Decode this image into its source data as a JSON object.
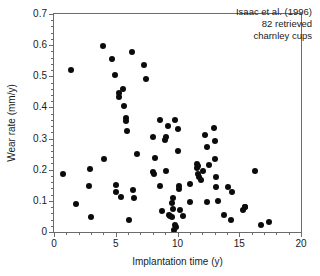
{
  "chart_data": {
    "type": "scatter",
    "title": "",
    "xlabel": "Implantation time (y)",
    "ylabel": "Wear rate (mm/y)",
    "xlim": [
      0,
      20
    ],
    "ylim": [
      0,
      0.7
    ],
    "xticks": [
      "0",
      "5",
      "10",
      "15",
      "20"
    ],
    "xtick_values": [
      0,
      5,
      10,
      15,
      20
    ],
    "yticks": [
      "0",
      "0.1",
      "0.2",
      "0.3",
      "0.4",
      "0.5",
      "0.6",
      "0.7"
    ],
    "ytick_values": [
      0,
      0.1,
      0.2,
      0.3,
      0.4,
      0.5,
      0.6,
      0.7
    ],
    "x_minor_step": 1,
    "y_minor_step": 0.02,
    "grid": false,
    "legend": "none",
    "marker": "filled-circle",
    "marker_color": "#0b0b0b",
    "marker_size_px": 6,
    "axis_color": "#6b6b6b",
    "n_points": 82,
    "series": [
      {
        "name": "82 retrieved charnley cups",
        "points": [
          [
            0.75,
            0.185
          ],
          [
            1.35,
            0.52
          ],
          [
            1.8,
            0.09
          ],
          [
            2.95,
            0.203
          ],
          [
            2.85,
            0.147
          ],
          [
            3.0,
            0.049
          ],
          [
            3.95,
            0.598
          ],
          [
            4.05,
            0.234
          ],
          [
            4.7,
            0.556
          ],
          [
            4.95,
            0.505
          ],
          [
            5.0,
            0.151
          ],
          [
            5.05,
            0.129
          ],
          [
            5.25,
            0.434
          ],
          [
            5.3,
            0.447
          ],
          [
            5.45,
            0.111
          ],
          [
            5.6,
            0.459
          ],
          [
            5.65,
            0.404
          ],
          [
            5.8,
            0.366
          ],
          [
            5.85,
            0.355
          ],
          [
            5.95,
            0.325
          ],
          [
            6.05,
            0.037
          ],
          [
            6.35,
            0.578
          ],
          [
            6.4,
            0.136
          ],
          [
            6.45,
            0.109
          ],
          [
            6.7,
            0.249
          ],
          [
            7.3,
            0.535
          ],
          [
            7.45,
            0.49
          ],
          [
            8.0,
            0.305
          ],
          [
            8.05,
            0.192
          ],
          [
            8.1,
            0.187
          ],
          [
            8.2,
            0.238
          ],
          [
            8.6,
            0.361
          ],
          [
            8.6,
            0.148
          ],
          [
            8.75,
            0.067
          ],
          [
            9.0,
            0.297
          ],
          [
            9.05,
            0.304
          ],
          [
            9.1,
            0.197
          ],
          [
            9.25,
            0.34
          ],
          [
            9.35,
            0.055
          ],
          [
            9.4,
            0.052
          ],
          [
            9.55,
            0.092
          ],
          [
            9.55,
            0.047
          ],
          [
            9.6,
            0.108
          ],
          [
            9.65,
            0.074
          ],
          [
            9.7,
            0.005
          ],
          [
            9.8,
            0.361
          ],
          [
            9.8,
            0.021
          ],
          [
            9.85,
            0.017
          ],
          [
            10.0,
            0.332
          ],
          [
            10.05,
            0.259
          ],
          [
            10.1,
            0.139
          ],
          [
            10.15,
            0.148
          ],
          [
            10.2,
            0.072
          ],
          [
            10.45,
            0.05
          ],
          [
            11.0,
            0.155
          ],
          [
            11.05,
            0.096
          ],
          [
            11.55,
            0.205
          ],
          [
            11.6,
            0.219
          ],
          [
            11.65,
            0.213
          ],
          [
            11.7,
            0.186
          ],
          [
            11.75,
            0.176
          ],
          [
            11.9,
            0.166
          ],
          [
            12.05,
            0.196
          ],
          [
            12.25,
            0.313
          ],
          [
            12.35,
            0.274
          ],
          [
            12.4,
            0.096
          ],
          [
            12.95,
            0.333
          ],
          [
            13.0,
            0.291
          ],
          [
            13.05,
            0.233
          ],
          [
            13.1,
            0.176
          ],
          [
            13.15,
            0.146
          ],
          [
            13.3,
            0.101
          ],
          [
            13.75,
            0.056
          ],
          [
            14.05,
            0.144
          ],
          [
            14.35,
            0.037
          ],
          [
            14.4,
            0.127
          ],
          [
            15.3,
            0.071
          ],
          [
            15.45,
            0.08
          ],
          [
            15.5,
            0.079
          ],
          [
            16.25,
            0.196
          ],
          [
            16.75,
            0.023
          ],
          [
            17.4,
            0.032
          ],
          [
            12.55,
            0.216
          ]
        ]
      }
    ],
    "annotation": {
      "line1": "Isaac et al. (1996)",
      "line2": "82 retrieved",
      "line3": "charnley cups"
    }
  }
}
